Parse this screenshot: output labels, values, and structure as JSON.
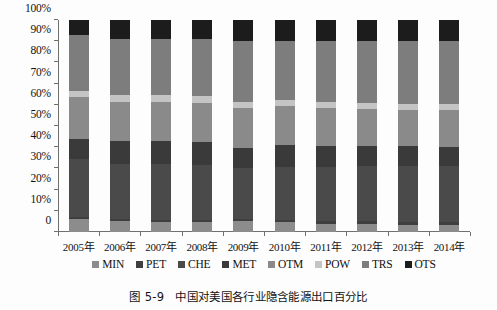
{
  "caption": {
    "number": "图 5-9",
    "text": "中国对美国各行业隐含能源出口百分比"
  },
  "axes": {
    "y_ticks": [
      "0",
      "10%",
      "20%",
      "30%",
      "40%",
      "50%",
      "60%",
      "70%",
      "80%",
      "90%",
      "100%"
    ],
    "x_ticks": [
      "2005年",
      "2006年",
      "2007年",
      "2008年",
      "2009年",
      "2010年",
      "2011年",
      "2012年",
      "2013年",
      "2014年"
    ]
  },
  "legend": {
    "items": [
      {
        "label": "MIN",
        "color": "#8c8c8c"
      },
      {
        "label": "PET",
        "color": "#3f3f3f"
      },
      {
        "label": "CHE",
        "color": "#4a4a4a"
      },
      {
        "label": "MET",
        "color": "#3a3a3a"
      },
      {
        "label": "OTM",
        "color": "#8a8a8a"
      },
      {
        "label": "POW",
        "color": "#c4c4c4"
      },
      {
        "label": "TRS",
        "color": "#7d7d7d"
      },
      {
        "label": "OTS",
        "color": "#1c1c1c"
      }
    ]
  },
  "chart_data": {
    "type": "bar",
    "stacked": true,
    "normalized": true,
    "title": "中国对美国各行业隐含能源出口百分比",
    "xlabel": "",
    "ylabel": "",
    "ylim": [
      0,
      100
    ],
    "ytick_values": [
      0,
      10,
      20,
      30,
      40,
      50,
      60,
      70,
      80,
      90,
      100
    ],
    "grid": false,
    "legend_position": "bottom",
    "categories": [
      "2005年",
      "2006年",
      "2007年",
      "2008年",
      "2009年",
      "2010年",
      "2011年",
      "2012年",
      "2013年",
      "2014年"
    ],
    "series": [
      {
        "name": "MIN",
        "color": "#8c8c8c",
        "values": [
          6.0,
          5.0,
          4.5,
          4.5,
          5.0,
          4.5,
          4.0,
          4.0,
          3.5,
          3.5
        ]
      },
      {
        "name": "PET",
        "color": "#3f3f3f",
        "values": [
          1.0,
          1.0,
          1.0,
          1.0,
          1.0,
          1.0,
          1.0,
          1.0,
          1.0,
          1.0
        ]
      },
      {
        "name": "CHE",
        "color": "#4a4a4a",
        "values": [
          27.5,
          26.0,
          26.5,
          26.0,
          24.0,
          25.0,
          25.5,
          26.0,
          26.5,
          26.5
        ]
      },
      {
        "name": "MET",
        "color": "#3a3a3a",
        "values": [
          9.5,
          11.0,
          11.0,
          11.0,
          9.5,
          10.5,
          10.0,
          9.5,
          9.5,
          9.0
        ]
      },
      {
        "name": "OTM",
        "color": "#8a8a8a",
        "values": [
          19.5,
          18.5,
          18.5,
          18.5,
          19.0,
          18.5,
          18.0,
          17.5,
          17.0,
          17.5
        ]
      },
      {
        "name": "POW",
        "color": "#c4c4c4",
        "values": [
          3.0,
          3.0,
          3.0,
          3.0,
          3.0,
          3.0,
          3.0,
          3.0,
          3.0,
          3.0
        ]
      },
      {
        "name": "TRS",
        "color": "#7d7d7d",
        "values": [
          26.5,
          26.5,
          26.5,
          27.0,
          28.5,
          27.5,
          28.5,
          29.0,
          29.5,
          29.5
        ]
      },
      {
        "name": "OTS",
        "color": "#1c1c1c",
        "values": [
          7.0,
          9.0,
          9.0,
          9.0,
          10.0,
          10.0,
          10.0,
          10.0,
          10.0,
          10.0
        ]
      }
    ]
  }
}
